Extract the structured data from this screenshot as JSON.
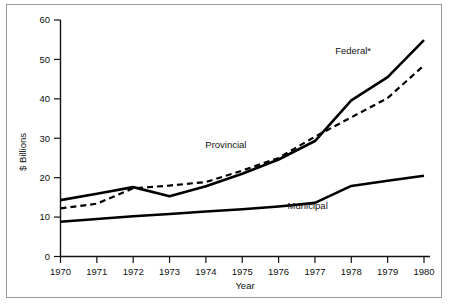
{
  "chart_data": {
    "type": "line",
    "title": "",
    "xlabel": "Year",
    "ylabel": "$ Billions",
    "x": [
      1970,
      1971,
      1972,
      1973,
      1974,
      1975,
      1976,
      1977,
      1978,
      1979,
      1980
    ],
    "xlim": [
      1970,
      1980.2
    ],
    "ylim": [
      0,
      60
    ],
    "xticks": [
      "1970",
      "1971",
      "1972",
      "1973",
      "1974",
      "1975",
      "1976",
      "1977",
      "1978",
      "1979",
      "1980"
    ],
    "yticks": [
      "0",
      "10",
      "20",
      "30",
      "40",
      "50",
      "60"
    ],
    "grid": false,
    "legend": "inline-annotations",
    "series": [
      {
        "name": "Federal*",
        "style": "solid",
        "label_x": 1978.05,
        "label_y": 51.5,
        "values": [
          14.3,
          15.9,
          17.6,
          15.3,
          17.8,
          21.0,
          24.6,
          29.3,
          39.6,
          45.5,
          54.9
        ]
      },
      {
        "name": "Provincial",
        "style": "dashed",
        "label_x": 1974.55,
        "label_y": 27.6,
        "values": [
          12.2,
          13.4,
          17.3,
          18.0,
          18.9,
          21.8,
          25.0,
          30.4,
          35.3,
          40.2,
          48.5
        ]
      },
      {
        "name": "Municipal",
        "style": "solid",
        "label_x": 1976.8,
        "label_y": 12.1,
        "values": [
          8.8,
          9.5,
          10.2,
          10.8,
          11.4,
          12.0,
          12.7,
          13.6,
          17.9,
          19.2,
          20.5
        ]
      }
    ]
  },
  "labels": {
    "y_axis_title": "$ Billions",
    "x_axis_title": "Year",
    "federal": "Federal*",
    "provincial": "Provincial",
    "municipal": "Municipal"
  },
  "colors": {
    "line": "#000000",
    "axis": "#111111",
    "background": "#ffffff",
    "frame": "#9a9a9a"
  }
}
